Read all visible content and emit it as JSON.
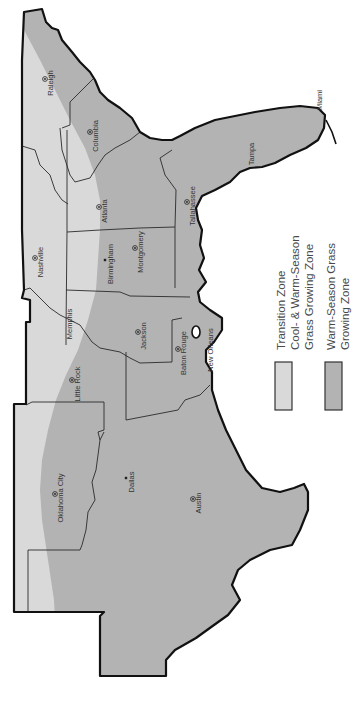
{
  "map": {
    "title": "Southeastern US Grass Growing Zones",
    "orientation": "rotated 90 degrees clockwise (north on left)",
    "colors": {
      "transition_zone": "#d9d9d9",
      "warm_season_zone": "#b3b3b3",
      "coastline": "#111111",
      "state_border": "#2a2a2a",
      "background": "#ffffff"
    },
    "cities": [
      {
        "name": "Raleigh",
        "marker": "capital",
        "x": 45,
        "y": 79
      },
      {
        "name": "Columbia",
        "marker": "capital",
        "x": 90,
        "y": 132
      },
      {
        "name": "Atlanta",
        "marker": "capital",
        "x": 99,
        "y": 207
      },
      {
        "name": "Tallahassee",
        "marker": "capital",
        "x": 187,
        "y": 202
      },
      {
        "name": "Tampa",
        "marker": "label-only",
        "x": 246,
        "y": 150
      },
      {
        "name": "Miami",
        "marker": "label-only",
        "x": 314,
        "y": 96
      },
      {
        "name": "Nashville",
        "marker": "capital",
        "x": 35,
        "y": 258
      },
      {
        "name": "Birmingham",
        "marker": "city",
        "x": 105,
        "y": 260
      },
      {
        "name": "Montgomery",
        "marker": "capital",
        "x": 135,
        "y": 248
      },
      {
        "name": "Memphis",
        "marker": "label-only",
        "x": 64,
        "y": 320
      },
      {
        "name": "Jackson",
        "marker": "capital",
        "x": 138,
        "y": 332
      },
      {
        "name": "Little Rock",
        "marker": "capital",
        "x": 72,
        "y": 380
      },
      {
        "name": "Baton Rouge",
        "marker": "capital",
        "x": 178,
        "y": 349
      },
      {
        "name": "New Orleans",
        "marker": "label-only",
        "x": 205,
        "y": 346
      },
      {
        "name": "Oklahoma City",
        "marker": "capital",
        "x": 55,
        "y": 494
      },
      {
        "name": "Dallas",
        "marker": "city",
        "x": 126,
        "y": 478
      },
      {
        "name": "Austin",
        "marker": "capital",
        "x": 193,
        "y": 499
      }
    ],
    "legend": [
      {
        "id": "transition",
        "lines": [
          "Transition Zone",
          "Cool- & Warm-Season",
          "Grass Growing Zone"
        ],
        "color": "#d9d9d9"
      },
      {
        "id": "warm-season",
        "lines": [
          "Warm-Season Grass",
          "Growing Zone"
        ],
        "color": "#b3b3b3"
      }
    ]
  }
}
